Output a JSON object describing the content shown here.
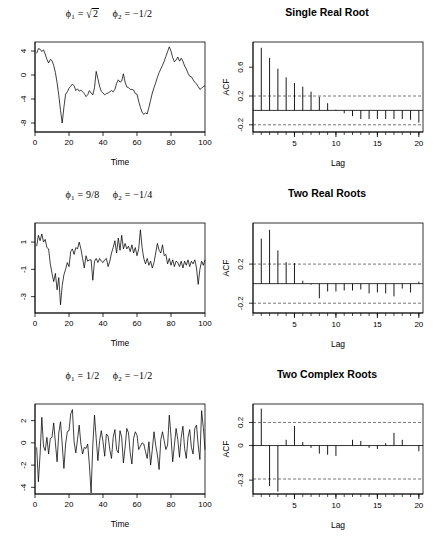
{
  "figure": {
    "rows": [
      {
        "left": {
          "title_phi1": "ϕ₁ = √2",
          "title_phi2": "ϕ2 = −1/2",
          "xlabel": "Time",
          "ylabel": ""
        },
        "right": {
          "title": "Single Real Root",
          "xlabel": "Lag",
          "ylabel": "ACF"
        }
      },
      {
        "left": {
          "title_phi1": "ϕ₁ = 9/8",
          "title_phi2": "ϕ2 = −1/4",
          "xlabel": "Time",
          "ylabel": ""
        },
        "right": {
          "title": "Two Real Roots",
          "xlabel": "Lag",
          "ylabel": "ACF"
        }
      },
      {
        "left": {
          "title_phi1": "ϕ₁ = 1/2",
          "title_phi2": "ϕ2 = −1/2",
          "xlabel": "Time",
          "ylabel": ""
        },
        "right": {
          "title": "Two Complex Roots",
          "xlabel": "Lag",
          "ylabel": "ACF"
        }
      }
    ]
  },
  "chart_data": [
    {
      "id": "ts-1",
      "type": "line",
      "title": "phi1 = sqrt(2), phi2 = -1/2",
      "xlabel": "Time",
      "ylabel": "",
      "xlim": [
        0,
        100
      ],
      "ylim": [
        -9.5,
        5.5
      ],
      "xticks": [
        0,
        20,
        40,
        60,
        80,
        100
      ],
      "yticks": [
        4,
        0,
        -4,
        -8
      ],
      "grid": false,
      "x": [
        1,
        2,
        3,
        4,
        5,
        6,
        7,
        8,
        9,
        10,
        11,
        12,
        13,
        14,
        15,
        16,
        17,
        18,
        19,
        20,
        21,
        22,
        23,
        24,
        25,
        26,
        27,
        28,
        29,
        30,
        31,
        32,
        33,
        34,
        35,
        36,
        37,
        38,
        39,
        40,
        41,
        42,
        43,
        44,
        45,
        46,
        47,
        48,
        49,
        50,
        51,
        52,
        53,
        54,
        55,
        56,
        57,
        58,
        59,
        60,
        61,
        62,
        63,
        64,
        65,
        66,
        67,
        68,
        69,
        70,
        71,
        72,
        73,
        74,
        75,
        76,
        77,
        78,
        79,
        80,
        81,
        82,
        83,
        84,
        85,
        86,
        87,
        88,
        89,
        90,
        91,
        92,
        93,
        94,
        95,
        96,
        97,
        98,
        99,
        100
      ],
      "values": [
        3.6,
        4.4,
        4.3,
        3.9,
        4.2,
        3.5,
        2.6,
        2.0,
        2.6,
        2.4,
        1.6,
        0.4,
        -1.3,
        -3.4,
        -5.9,
        -8.0,
        -5.4,
        -3.2,
        -2.8,
        -2.2,
        -1.9,
        -1.5,
        -1.8,
        -2.6,
        -2.3,
        -2.7,
        -2.5,
        -2.8,
        -3.1,
        -3.6,
        -3.3,
        -2.6,
        -3.0,
        -3.3,
        -2.1,
        0.6,
        -0.6,
        -1.9,
        -2.7,
        -3.0,
        -3.3,
        -3.1,
        -3.0,
        -2.8,
        -2.6,
        -2.8,
        -2.4,
        -1.4,
        -0.8,
        -1.2,
        -1.0,
        0.2,
        -1.2,
        -2.0,
        -2.1,
        -2.4,
        -2.4,
        -2.5,
        -3.1,
        -3.2,
        -4.4,
        -5.4,
        -6.2,
        -6.6,
        -6.3,
        -6.5,
        -5.4,
        -4.2,
        -3.0,
        -2.1,
        -1.3,
        -0.4,
        0.4,
        1.0,
        1.6,
        2.3,
        3.1,
        3.9,
        4.7,
        4.0,
        2.9,
        2.2,
        2.5,
        3.0,
        2.3,
        2.8,
        2.3,
        1.5,
        1.0,
        0.3,
        -0.2,
        -0.3,
        -0.8,
        -1.2,
        -1.5,
        -1.9,
        -2.4,
        -2.2,
        -1.9,
        -1.8
      ]
    },
    {
      "id": "acf-1",
      "type": "bar",
      "title": "Single Real Root",
      "xlabel": "Lag",
      "ylabel": "ACF",
      "xlim": [
        0,
        20.5
      ],
      "ylim": [
        -0.3,
        0.95
      ],
      "xticks": [
        5,
        10,
        15,
        20
      ],
      "yticks": [
        0.6,
        0.2,
        -0.2
      ],
      "grid": false,
      "conf_bounds": [
        0.2,
        -0.2
      ],
      "categories": [
        1,
        2,
        3,
        4,
        5,
        6,
        7,
        8,
        9,
        10,
        11,
        12,
        13,
        14,
        15,
        16,
        17,
        18,
        19,
        20
      ],
      "values": [
        0.87,
        0.73,
        0.58,
        0.46,
        0.38,
        0.33,
        0.26,
        0.19,
        0.1,
        0.01,
        -0.04,
        -0.08,
        -0.12,
        -0.12,
        -0.12,
        -0.12,
        -0.12,
        -0.12,
        -0.13,
        -0.17
      ]
    },
    {
      "id": "ts-2",
      "type": "line",
      "title": "phi1 = 9/8, phi2 = -1/4",
      "xlabel": "Time",
      "ylabel": "",
      "xlim": [
        0,
        100
      ],
      "ylim": [
        -4.2,
        2.4
      ],
      "xticks": [
        0,
        20,
        40,
        60,
        80,
        100
      ],
      "yticks": [
        1,
        -1,
        -3
      ],
      "grid": false,
      "x": [
        1,
        2,
        3,
        4,
        5,
        6,
        7,
        8,
        9,
        10,
        11,
        12,
        13,
        14,
        15,
        16,
        17,
        18,
        19,
        20,
        21,
        22,
        23,
        24,
        25,
        26,
        27,
        28,
        29,
        30,
        31,
        32,
        33,
        34,
        35,
        36,
        37,
        38,
        39,
        40,
        41,
        42,
        43,
        44,
        45,
        46,
        47,
        48,
        49,
        50,
        51,
        52,
        53,
        54,
        55,
        56,
        57,
        58,
        59,
        60,
        61,
        62,
        63,
        64,
        65,
        66,
        67,
        68,
        69,
        70,
        71,
        72,
        73,
        74,
        75,
        76,
        77,
        78,
        79,
        80,
        81,
        82,
        83,
        84,
        85,
        86,
        87,
        88,
        89,
        90,
        91,
        92,
        93,
        94,
        95,
        96,
        97,
        98,
        99,
        100
      ],
      "values": [
        0.7,
        1.5,
        1.1,
        1.6,
        1.0,
        1.2,
        0.6,
        0.5,
        -0.6,
        -1.3,
        -1.9,
        -1.3,
        -2.5,
        -1.6,
        -3.6,
        -2.2,
        -1.4,
        -1.0,
        -0.5,
        -0.8,
        0.3,
        0.5,
        0.1,
        0.6,
        0.5,
        1.0,
        0.5,
        -0.2,
        -0.9,
        0.0,
        -0.4,
        -0.3,
        -0.3,
        -1.8,
        -0.4,
        -0.2,
        -0.5,
        -0.2,
        -0.4,
        -0.5,
        -0.3,
        -0.2,
        -0.8,
        -0.4,
        0.2,
        0.6,
        1.1,
        0.2,
        1.3,
        0.4,
        1.5,
        0.5,
        0.9,
        0.5,
        0.7,
        0.3,
        0.8,
        0.2,
        0.6,
        0.0,
        0.5,
        1.9,
        0.6,
        -0.2,
        -0.6,
        -0.2,
        -0.7,
        -0.4,
        -0.9,
        -0.5,
        0.2,
        0.9,
        0.4,
        0.2,
        0.8,
        0.0,
        0.1,
        -0.6,
        -0.2,
        -0.7,
        -0.3,
        -0.8,
        -0.4,
        -0.5,
        -0.8,
        -0.4,
        -0.9,
        -0.4,
        -0.7,
        -0.3,
        -0.8,
        -0.4,
        -0.6,
        -0.3,
        -0.9,
        -2.1,
        -1.0,
        -0.4,
        -0.7,
        -0.3
      ]
    },
    {
      "id": "acf-2",
      "type": "bar",
      "title": "Two Real Roots",
      "xlabel": "Lag",
      "ylabel": "ACF",
      "xlim": [
        0,
        20.5
      ],
      "ylim": [
        -0.3,
        0.62
      ],
      "xticks": [
        5,
        10,
        15,
        20
      ],
      "yticks": [
        0.2,
        -0.2
      ],
      "grid": false,
      "conf_bounds": [
        0.2,
        -0.2
      ],
      "categories": [
        1,
        2,
        3,
        4,
        5,
        6,
        7,
        8,
        9,
        10,
        11,
        12,
        13,
        14,
        15,
        16,
        17,
        18,
        19,
        20
      ],
      "values": [
        0.46,
        0.55,
        0.34,
        0.22,
        0.21,
        0.03,
        -0.01,
        -0.15,
        -0.08,
        -0.08,
        -0.07,
        -0.07,
        -0.06,
        -0.1,
        -0.09,
        -0.1,
        -0.13,
        -0.05,
        -0.09,
        0.02
      ]
    },
    {
      "id": "ts-3",
      "type": "line",
      "title": "phi1 = 1/2, phi2 = -1/2",
      "xlabel": "Time",
      "ylabel": "",
      "xlim": [
        0,
        100
      ],
      "ylim": [
        -4.6,
        3.5
      ],
      "xticks": [
        0,
        20,
        40,
        60,
        80,
        100
      ],
      "yticks": [
        2,
        0,
        -2,
        -4
      ],
      "grid": false,
      "x": [
        1,
        2,
        3,
        4,
        5,
        6,
        7,
        8,
        9,
        10,
        11,
        12,
        13,
        14,
        15,
        16,
        17,
        18,
        19,
        20,
        21,
        22,
        23,
        24,
        25,
        26,
        27,
        28,
        29,
        30,
        31,
        32,
        33,
        34,
        35,
        36,
        37,
        38,
        39,
        40,
        41,
        42,
        43,
        44,
        45,
        46,
        47,
        48,
        49,
        50,
        51,
        52,
        53,
        54,
        55,
        56,
        57,
        58,
        59,
        60,
        61,
        62,
        63,
        64,
        65,
        66,
        67,
        68,
        69,
        70,
        71,
        72,
        73,
        74,
        75,
        76,
        77,
        78,
        79,
        80,
        81,
        82,
        83,
        84,
        85,
        86,
        87,
        88,
        89,
        90,
        91,
        92,
        93,
        94,
        95,
        96,
        97,
        98,
        99,
        100
      ],
      "values": [
        -0.4,
        -3.5,
        -1.0,
        2.3,
        -0.3,
        -0.7,
        0.5,
        -1.0,
        0.4,
        0.5,
        1.8,
        0.0,
        -1.7,
        0.9,
        1.9,
        -0.1,
        -2.3,
        -0.1,
        1.0,
        1.1,
        2.6,
        3.0,
        0.1,
        -0.9,
        0.3,
        1.6,
        -0.1,
        -1.0,
        -0.4,
        -0.5,
        -0.1,
        -2.0,
        -4.5,
        -0.2,
        2.5,
        0.4,
        -1.6,
        0.2,
        1.1,
        0.1,
        -1.2,
        0.8,
        0.6,
        -0.6,
        -1.4,
        0.5,
        1.2,
        -0.6,
        -0.9,
        1.1,
        0.5,
        -1.8,
        -0.4,
        1.3,
        0.9,
        -0.9,
        -1.9,
        0.4,
        1.0,
        0.7,
        -0.6,
        -0.3,
        0.0,
        -0.1,
        -0.8,
        -1.4,
        0.1,
        -2.0,
        -0.6,
        1.0,
        -0.2,
        -1.1,
        -2.4,
        0.3,
        1.0,
        0.2,
        -0.6,
        -0.2,
        2.5,
        0.6,
        -1.7,
        -0.2,
        1.3,
        0.3,
        -1.3,
        0.5,
        1.5,
        -0.5,
        -1.4,
        0.5,
        1.2,
        -0.4,
        -1.0,
        1.3,
        1.6,
        -0.2,
        -1.5,
        2.9,
        1.4,
        -0.6,
        0.4
      ]
    },
    {
      "id": "acf-3",
      "type": "bar",
      "title": "Two Complex Roots",
      "xlabel": "Lag",
      "ylabel": "ACF",
      "xlim": [
        0,
        20.5
      ],
      "ylim": [
        -0.42,
        0.36
      ],
      "xticks": [
        5,
        10,
        15,
        20
      ],
      "yticks": [
        0.2,
        0.0,
        -0.3
      ],
      "grid": false,
      "conf_bounds": [
        0.2,
        -0.29
      ],
      "categories": [
        1,
        2,
        3,
        4,
        5,
        6,
        7,
        8,
        9,
        10,
        11,
        12,
        13,
        14,
        15,
        16,
        17,
        18,
        19,
        20
      ],
      "values": [
        0.32,
        -0.35,
        -0.4,
        0.05,
        0.17,
        0.03,
        -0.02,
        -0.07,
        -0.08,
        -0.09,
        0.0,
        0.05,
        0.04,
        -0.02,
        -0.03,
        0.02,
        0.11,
        0.05,
        0.0,
        -0.05
      ]
    }
  ]
}
